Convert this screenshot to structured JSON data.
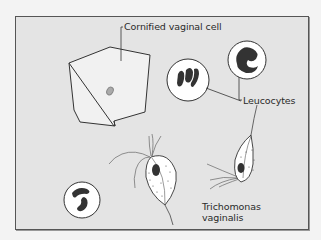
{
  "figure": {
    "background": "#e4e4e4",
    "border_color": "#555555",
    "labels": {
      "cornified_cell": "Cornified vaginal cell",
      "leucocytes": "Leucocytes",
      "trichomonas_line1": "Trichomonas",
      "trichomonas_line2": "vaginalis"
    },
    "elements": [
      {
        "name": "cornified-vaginal-cell",
        "type": "polygonal squamous cell"
      },
      {
        "name": "leucocyte",
        "count": 3
      },
      {
        "name": "trichomonas-vaginalis",
        "count": 2
      }
    ]
  }
}
